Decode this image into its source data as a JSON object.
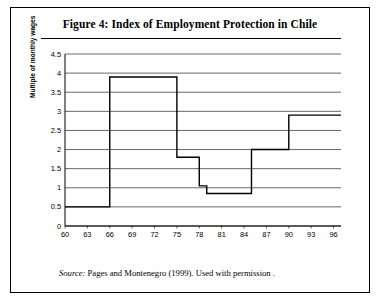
{
  "figure": {
    "title": "Figure 4: Index of Employment Protection in Chile",
    "source_label": "Source:",
    "source_text": " Pages and Montenegro (1999). Used with  permission ."
  },
  "chart_data": {
    "type": "line",
    "title": "Figure 4: Index of Employment Protection in Chile",
    "xlabel": "",
    "ylabel": "Multiple of monthly wages",
    "ylim": [
      0,
      4.5
    ],
    "ytick_values": [
      0,
      0.5,
      1,
      1.5,
      2,
      2.5,
      3,
      3.5,
      4,
      4.5
    ],
    "ytick_labels": [
      "0",
      "0.5",
      "1",
      "1.5",
      "2",
      "2.5",
      "3",
      "3.5",
      "4",
      "4.5"
    ],
    "xlim": [
      60,
      97
    ],
    "xtick_values": [
      60,
      63,
      66,
      69,
      72,
      75,
      78,
      81,
      84,
      87,
      90,
      93,
      96
    ],
    "xtick_labels": [
      "60",
      "63",
      "66",
      "69",
      "72",
      "75",
      "78",
      "81",
      "84",
      "87",
      "90",
      "93",
      "96"
    ],
    "grid": "horizontal",
    "legend": "none",
    "series": [
      {
        "name": "Index of Employment Protection",
        "x": [
          60,
          61,
          62,
          63,
          64,
          65,
          66,
          67,
          68,
          69,
          70,
          71,
          72,
          73,
          74,
          75,
          76,
          77,
          78,
          79,
          80,
          81,
          82,
          83,
          84,
          85,
          86,
          87,
          88,
          89,
          90,
          91,
          92,
          93,
          94,
          95,
          96,
          97
        ],
        "values": [
          0.5,
          0.5,
          0.5,
          0.5,
          0.5,
          0.5,
          3.9,
          3.9,
          3.9,
          3.9,
          3.9,
          3.9,
          3.9,
          3.9,
          3.9,
          1.8,
          1.8,
          1.8,
          1.05,
          0.85,
          0.85,
          0.85,
          0.85,
          0.85,
          0.85,
          2.0,
          2.0,
          2.0,
          2.0,
          2.0,
          2.9,
          2.9,
          2.9,
          2.9,
          2.9,
          2.9,
          2.9,
          2.9
        ]
      }
    ]
  }
}
